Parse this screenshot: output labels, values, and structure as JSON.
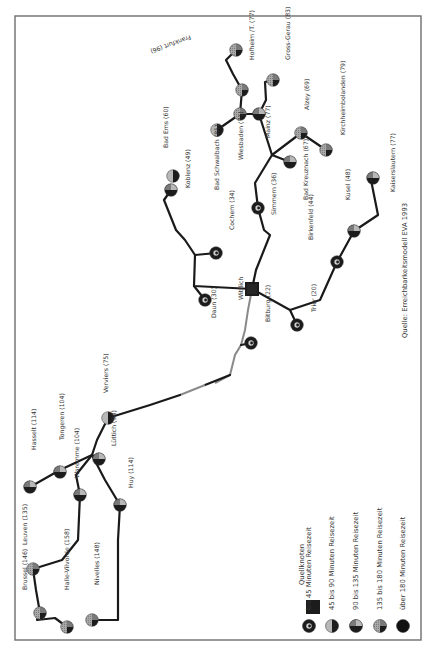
{
  "map": {
    "source_note": "Quelle: Erreichbarkeitsmodell EVA 1993",
    "origin_node": {
      "name": "Wittlich",
      "x": 252,
      "y": 289
    },
    "nodes": [
      {
        "name": "Frankfurt (96)",
        "x": 236,
        "y": 50,
        "cls": "c4",
        "lx": 190,
        "ly": 35,
        "flip": true
      },
      {
        "name": "Hofheim /T. (77)",
        "x": 242,
        "y": 90,
        "cls": "c4",
        "lx": 254,
        "ly": 60
      },
      {
        "name": "Gross-Gerau (83)",
        "x": 273,
        "y": 80,
        "cls": "c4",
        "lx": 290,
        "ly": 60
      },
      {
        "name": "Wiesbaden (71)",
        "x": 240,
        "y": 114,
        "cls": "c4",
        "lx": 243,
        "ly": 160
      },
      {
        "name": "Mainz (77)",
        "x": 259,
        "y": 114,
        "cls": "c3",
        "lx": 270,
        "ly": 138
      },
      {
        "name": "Alzey (69)",
        "x": 301,
        "y": 133,
        "cls": "c4",
        "lx": 309,
        "ly": 110
      },
      {
        "name": "Kirchheimbolanden (79)",
        "x": 326,
        "y": 150,
        "cls": "c4",
        "lx": 345,
        "ly": 135
      },
      {
        "name": "Bad Kreuznach (67)",
        "x": 290,
        "y": 162,
        "cls": "c3",
        "lx": 308,
        "ly": 200
      },
      {
        "name": "Kaiserslautern (77)",
        "x": 373,
        "y": 178,
        "cls": "c3",
        "lx": 395,
        "ly": 192
      },
      {
        "name": "Bad Ems (60)",
        "x": 173,
        "y": 176,
        "cls": "c2",
        "lx": 168,
        "ly": 148
      },
      {
        "name": "Koblenz (49)",
        "x": 171,
        "y": 190,
        "cls": "c3",
        "lx": 190,
        "ly": 188
      },
      {
        "name": "Bad Schwalbach (85)",
        "x": 217,
        "y": 130,
        "cls": "c2",
        "lx": 219,
        "ly": 190
      },
      {
        "name": "Simmern (36)",
        "x": 258,
        "y": 208,
        "cls": "c1",
        "lx": 276,
        "ly": 215
      },
      {
        "name": "Kusel (48)",
        "x": 354,
        "y": 231,
        "cls": "c3",
        "lx": 350,
        "ly": 200
      },
      {
        "name": "Birkenfeld (44)",
        "x": 337,
        "y": 262,
        "cls": "c1",
        "lx": 313,
        "ly": 240
      },
      {
        "name": "Cochem (34)",
        "x": 216,
        "y": 253,
        "cls": "c1",
        "lx": 234,
        "ly": 230
      },
      {
        "name": "Daun (30)",
        "x": 205,
        "y": 300,
        "cls": "c1",
        "lx": 216,
        "ly": 318
      },
      {
        "name": "Bitburg (22)",
        "x": 251,
        "y": 343,
        "cls": "c1",
        "lx": 270,
        "ly": 322
      },
      {
        "name": "Trier (20)",
        "x": 297,
        "y": 325,
        "cls": "c1",
        "lx": 316,
        "ly": 312
      },
      {
        "name": "Verviers (75)",
        "x": 108,
        "y": 418,
        "cls": "c2",
        "lx": 108,
        "ly": 393
      },
      {
        "name": "Lüttich (94)",
        "x": 99,
        "y": 459,
        "cls": "c3",
        "lx": 116,
        "ly": 446
      },
      {
        "name": "Tongeren (104)",
        "x": 60,
        "y": 472,
        "cls": "c3",
        "lx": 64,
        "ly": 440
      },
      {
        "name": "Waremme (104)",
        "x": 80,
        "y": 495,
        "cls": "c3",
        "lx": 79,
        "ly": 478
      },
      {
        "name": "Hasselt (114)",
        "x": 30,
        "y": 487,
        "cls": "c3",
        "lx": 36,
        "ly": 450
      },
      {
        "name": "Huy (114)",
        "x": 120,
        "y": 505,
        "cls": "c3",
        "lx": 133,
        "ly": 488
      },
      {
        "name": "Leuven (135)",
        "x": 33,
        "y": 569,
        "cls": "c4",
        "lx": 27,
        "ly": 545
      },
      {
        "name": "Brussel (146)",
        "x": 40,
        "y": 613,
        "cls": "c4",
        "lx": 27,
        "ly": 590
      },
      {
        "name": "Halle-Vilvorde (158)",
        "x": 67,
        "y": 627,
        "cls": "c4",
        "lx": 69,
        "ly": 590
      },
      {
        "name": "Nivelles (148)",
        "x": 92,
        "y": 620,
        "cls": "c4",
        "lx": 99,
        "ly": 585
      }
    ]
  },
  "legend": {
    "title": "Quellknoten",
    "items": [
      {
        "label": "bis 45 Minuten Reisezeit",
        "cls": "c1"
      },
      {
        "label": "45 bis 90 Minuten Reisezeit",
        "cls": "c2"
      },
      {
        "label": "90 bis 135 Minuten Reisezeit",
        "cls": "c3"
      },
      {
        "label": "135 bis 180 Minuten Reisezeit",
        "cls": "c4"
      },
      {
        "label": "über 180 Minuten Reisezeit",
        "cls": "c5"
      }
    ]
  },
  "colors": {
    "frame": "#6e6e6e",
    "route": "#1a1a1a",
    "route_grey": "#8a8a8a",
    "dark": "#1c1c1c",
    "mid": "#7a7a7a",
    "light": "#b8b8b8",
    "hatch": "#9a9a9a"
  }
}
